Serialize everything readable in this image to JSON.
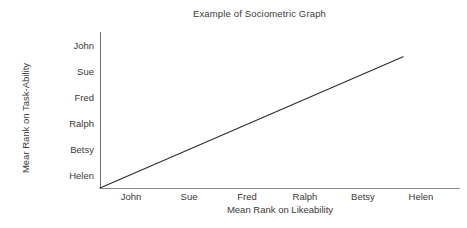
{
  "chart_data": {
    "type": "line",
    "title": "Example of Sociometric Graph",
    "xlabel": "Mean Rank on Likeability",
    "ylabel": "Mear Rank on Task-Ability",
    "grid": false,
    "legend": null,
    "x_categories": [
      "John",
      "Sue",
      "Fred",
      "Ralph",
      "Betsy",
      "Helen"
    ],
    "y_categories_bottom_to_top": [
      "Helen",
      "Betsy",
      "Ralph",
      "Fred",
      "Sue",
      "John"
    ],
    "y_categories_top_to_bottom": [
      "John",
      "Sue",
      "Fred",
      "Ralph",
      "Betsy",
      "Helen"
    ],
    "xlim": [
      0,
      6.2
    ],
    "ylim": [
      0,
      6.2
    ],
    "series": [
      {
        "name": "perfect rank correspondence",
        "style": "solid",
        "color": "#2b2b2b",
        "points": [
          {
            "x": 0.0,
            "y": 0.0
          },
          {
            "x": 5.22,
            "y": 5.22
          }
        ]
      }
    ],
    "annotations": []
  },
  "figure": {
    "title": "Example of Sociometric Graph",
    "axis": {
      "x_title": "Mean Rank on Likeability",
      "y_title": "Mear Rank on Task-Ability"
    },
    "x_ticks": [
      {
        "label": "John"
      },
      {
        "label": "Sue"
      },
      {
        "label": "Fred"
      },
      {
        "label": "Ralph"
      },
      {
        "label": "Betsy"
      },
      {
        "label": "Helen"
      }
    ],
    "y_ticks": [
      {
        "label": "John"
      },
      {
        "label": "Sue"
      },
      {
        "label": "Fred"
      },
      {
        "label": "Ralph"
      },
      {
        "label": "Betsy"
      },
      {
        "label": "Helen"
      }
    ],
    "colors": {
      "background": "#ffffff",
      "text": "#3a3a3a",
      "axis": "#7a7a7a",
      "line": "#2b2b2b"
    }
  }
}
